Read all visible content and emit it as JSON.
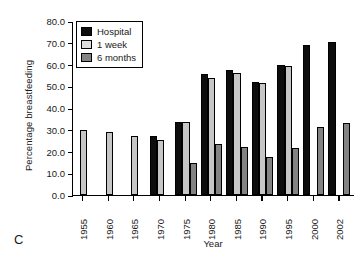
{
  "panel": {
    "letter": "C"
  },
  "legend": {
    "position": "top-left-inside",
    "entries": [
      {
        "label": "Hospital",
        "color": "#0d0d0d",
        "key": "hospital"
      },
      {
        "label": "1 week",
        "color": "#dcdcdc",
        "key": "week"
      },
      {
        "label": "6 months",
        "color": "#838383",
        "key": "months"
      }
    ]
  },
  "axes": {
    "y_title": "Percentage breastfeeding",
    "x_title": "Year",
    "y_ticks": [
      "0.0",
      "10.0",
      "20.0",
      "30.0",
      "40.0",
      "50.0",
      "60.0",
      "70.0",
      "80.0"
    ]
  },
  "chart_data": {
    "type": "bar",
    "title": "",
    "xlabel": "Year",
    "ylabel": "Percentage breastfeeding",
    "ylim": [
      0,
      80
    ],
    "ytick_step": 10,
    "grid": false,
    "legend_position": "upper left",
    "categories": [
      "1955",
      "1960",
      "1965",
      "1970",
      "1975",
      "1980",
      "1985",
      "1990",
      "1995",
      "2000",
      "2002"
    ],
    "series": [
      {
        "name": "Hospital",
        "color": "#0d0d0d",
        "values": [
          null,
          null,
          null,
          27.0,
          33.5,
          55.5,
          57.5,
          52.0,
          60.0,
          69.0,
          70.5
        ]
      },
      {
        "name": "1 week",
        "color": "#c6c6c6",
        "values": [
          29.8,
          28.8,
          27.2,
          25.3,
          33.5,
          54.0,
          56.0,
          51.5,
          59.5,
          null,
          null
        ]
      },
      {
        "name": "6 months",
        "color": "#838383",
        "values": [
          null,
          null,
          null,
          null,
          14.7,
          23.5,
          22.2,
          17.5,
          21.5,
          31.5,
          33.0
        ]
      }
    ]
  }
}
